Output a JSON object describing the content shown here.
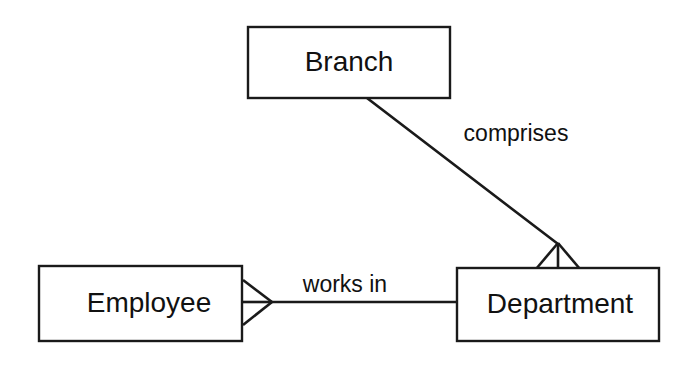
{
  "diagram": {
    "type": "entity-relationship-diagram",
    "notation": "crow's foot",
    "background_color": "#ffffff",
    "line_color": "#1a1a1a",
    "text_color": "#111111",
    "entities": [
      {
        "id": "branch",
        "label": "Branch",
        "x": 248,
        "y": 27,
        "width": 202,
        "height": 71,
        "label_cx": 349,
        "label_cy": 63
      },
      {
        "id": "employee",
        "label": "Employee",
        "x": 39,
        "y": 266,
        "width": 203,
        "height": 75,
        "label_cx": 149,
        "label_cy": 304
      },
      {
        "id": "department",
        "label": "Department",
        "x": 457,
        "y": 268,
        "width": 202,
        "height": 73,
        "label_cx": 560,
        "label_cy": 305
      }
    ],
    "relationships": [
      {
        "id": "comprises",
        "label": "comprises",
        "from": "branch",
        "to": "department",
        "label_cx": 516,
        "label_cy": 135,
        "line": {
          "x1": 367,
          "y1": 98,
          "x2": 558,
          "y2": 244
        },
        "many_end": "department"
      },
      {
        "id": "works-in",
        "label": "works in",
        "from": "employee",
        "to": "department",
        "label_cx": 345,
        "label_cy": 285,
        "line": {
          "x1": 272,
          "y1": 302,
          "x2": 457,
          "y2": 302
        },
        "many_end": "employee"
      }
    ]
  }
}
